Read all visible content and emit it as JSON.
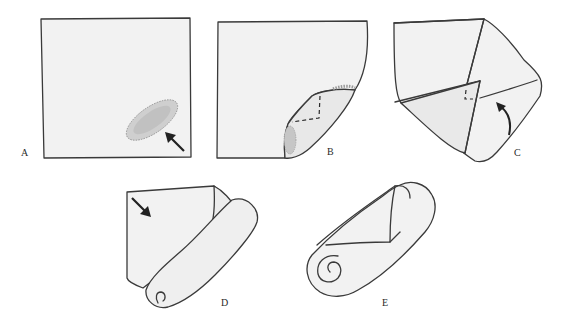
{
  "figure": {
    "panels": [
      {
        "id": "A",
        "label": "A",
        "description": "Flat square cloth with padding placed near lower-right corner; arrow points to padding"
      },
      {
        "id": "B",
        "label": "B",
        "description": "Lower-right corner folded up over padding; dashed lines indicate fold"
      },
      {
        "id": "C",
        "label": "C",
        "description": "Corners folded toward center forming envelope shape; curved arrow indicates direction"
      },
      {
        "id": "D",
        "label": "D",
        "description": "Cloth being rolled from bottom; arrow indicates rolling direction"
      },
      {
        "id": "E",
        "label": "E",
        "description": "Fully rolled cylinder with spiral end visible"
      }
    ]
  },
  "colors": {
    "ink": "#3a3a3a",
    "paper": "#f2f2f2",
    "shade": "#e4e4e4",
    "padding": "#b8b8b8",
    "background": "#ffffff"
  }
}
